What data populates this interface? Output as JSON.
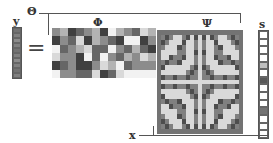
{
  "labels": {
    "theta": "Θ",
    "y": "y",
    "equals": "=",
    "phi": "Φ",
    "psi": "Ψ",
    "s": "s",
    "x": "x"
  },
  "equation": "y = Θ s = Φ Ψ s",
  "vectors": {
    "y": {
      "length": 10,
      "cells": [
        0.45,
        0.5,
        0.55,
        0.5,
        0.45,
        0.5,
        0.55,
        0.5,
        0.45,
        0.5
      ]
    },
    "s": {
      "length": 14,
      "cells": [
        1,
        1,
        1,
        1,
        0.75,
        1,
        0.35,
        1,
        1,
        1,
        0.45,
        1,
        1,
        1
      ]
    }
  },
  "matrices": {
    "phi": {
      "rows": 6,
      "cols": 13,
      "description": "random measurement matrix"
    },
    "psi": {
      "rows": 21,
      "cols": 21,
      "description": "basis matrix with concentric pattern"
    }
  },
  "colors": {
    "line": "#555555",
    "background": "#ffffff"
  }
}
